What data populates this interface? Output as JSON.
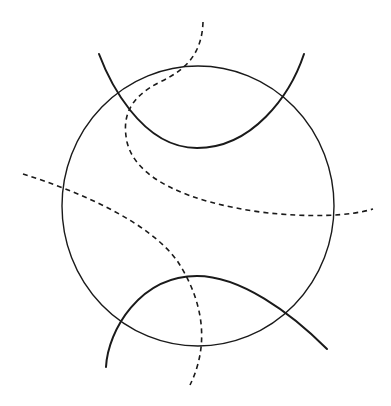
{
  "diagram": {
    "type": "geometric-figure",
    "stroke_color": "#1a1a1a",
    "background": "#ffffff",
    "circle": {
      "cx": 198,
      "cy": 206,
      "rx": 136,
      "ry": 140
    },
    "curves": [
      {
        "name": "top-solid-arc",
        "style": "solid",
        "path": "M99,54 C108,78 140,148 197,148 C252,148 290,96 304,54"
      },
      {
        "name": "bottom-solid-arch",
        "style": "solid",
        "path": "M106,367 C108,330 140,276 197,276 C240,276 290,312 327,349"
      },
      {
        "name": "top-dashed-curve",
        "style": "dashed",
        "path": "M203,22 C202,50 190,68 160,82 C128,98 122,118 127,142 C136,180 190,202 260,212 C310,218 350,216 373,209"
      },
      {
        "name": "left-dashed-curve",
        "style": "dashed",
        "path": "M23,174 C80,192 150,222 178,262 C200,296 212,340 190,385"
      }
    ]
  }
}
